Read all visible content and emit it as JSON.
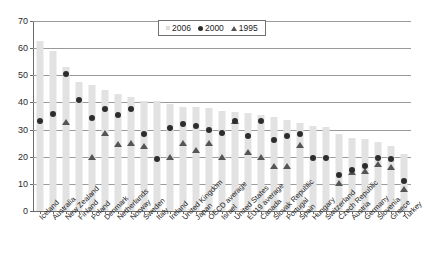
{
  "chart_data": {
    "type": "bar",
    "title": "",
    "subtitle": "",
    "xlabel": "",
    "ylabel": "",
    "ylim": [
      0,
      70
    ],
    "yticks": [
      0,
      10,
      20,
      30,
      40,
      50,
      60,
      70
    ],
    "grid": true,
    "legend_position": "top-center",
    "categories": [
      "Iceland",
      "Australia",
      "New Zealand",
      "Finland",
      "Poland",
      "Denmark",
      "Netherlands",
      "Norway",
      "Sweden",
      "Italy",
      "Ireland",
      "United Kingdom",
      "Japan",
      "OECD average",
      "Israel",
      "United States",
      "EU19 average",
      "Canada",
      "Slovak Republic",
      "Portugal",
      "Spain",
      "Hungary",
      "Switzerland",
      "Czech Republic",
      "Austria",
      "Germany",
      "Slovenia",
      "Greece",
      "Turkey"
    ],
    "series": [
      {
        "name": "2006",
        "marker": "bar",
        "color": "#e2e2e2",
        "values": [
          62.5,
          59.0,
          53.0,
          47.5,
          46.5,
          44.5,
          43.0,
          42.0,
          40.5,
          40.5,
          39.5,
          38.5,
          38.5,
          38.0,
          37.0,
          36.5,
          36.0,
          35.5,
          34.5,
          33.5,
          32.5,
          31.5,
          31.0,
          28.5,
          27.0,
          26.5,
          25.5,
          24.0,
          21.0
        ]
      },
      {
        "name": "2000",
        "marker": "circle",
        "color": "#2d2d2d",
        "values": [
          33.2,
          35.7,
          50.3,
          40.8,
          34.4,
          37.5,
          35.3,
          37.7,
          28.5,
          19.2,
          30.6,
          32.0,
          31.5,
          29.7,
          28.9,
          33.3,
          27.5,
          33.2,
          26.2,
          27.8,
          28.3,
          19.7,
          19.6,
          13.2,
          15.0,
          16.5,
          19.4,
          19.2,
          11.2
        ]
      },
      {
        "name": "1995",
        "marker": "triangle",
        "color": "#555555",
        "values": [
          null,
          null,
          32.8,
          null,
          19.9,
          28.6,
          24.7,
          25.2,
          23.9,
          null,
          20.0,
          25.0,
          22.5,
          25.2,
          19.9,
          33.0,
          21.8,
          19.9,
          16.5,
          16.6,
          24.4,
          null,
          null,
          10.5,
          14.2,
          14.9,
          17.5,
          16.3,
          8.2
        ]
      }
    ]
  },
  "legend": {
    "entries": [
      {
        "label": "2006",
        "marker": "bar-swatch"
      },
      {
        "label": "2000",
        "marker": "circle-swatch"
      },
      {
        "label": "1995",
        "marker": "triangle-swatch"
      }
    ]
  },
  "colors": {
    "bar": "#e2e2e2",
    "circle": "#2d2d2d",
    "triangle": "#555555",
    "grid": "#9a9a9a",
    "axis": "#6b6b6b",
    "text": "#232323"
  }
}
